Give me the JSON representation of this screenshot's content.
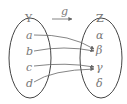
{
  "diagram": {
    "function_label": "g",
    "domain": {
      "name": "Y",
      "elements": [
        "a",
        "b",
        "c",
        "d"
      ]
    },
    "codomain": {
      "name": "Z",
      "elements": [
        "α",
        "β",
        "γ",
        "δ"
      ]
    },
    "mappings": [
      {
        "from": "a",
        "to": "β"
      },
      {
        "from": "b",
        "to": "β"
      },
      {
        "from": "c",
        "to": "γ"
      },
      {
        "from": "d",
        "to": "γ"
      }
    ],
    "colors": {
      "stroke": "#444444",
      "text": "#777777"
    }
  }
}
